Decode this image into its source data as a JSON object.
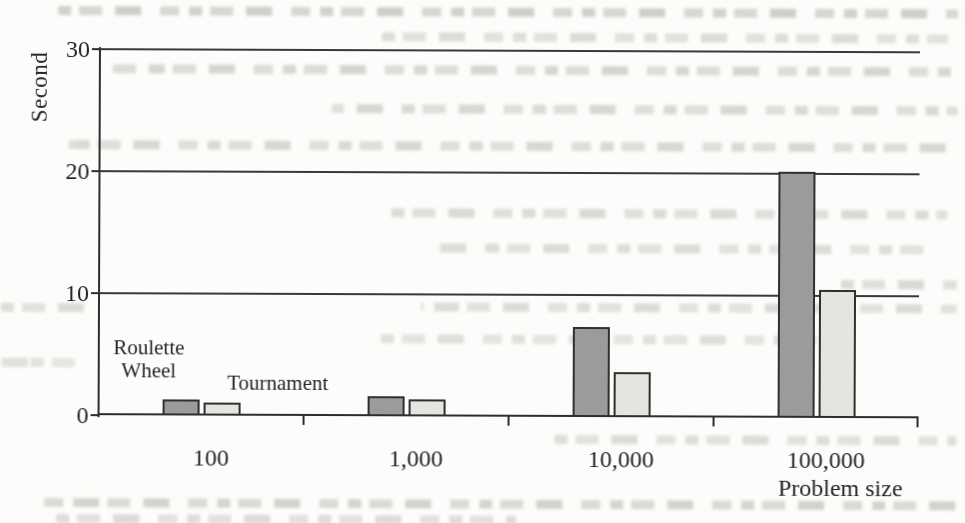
{
  "page": {
    "background": "#fcfcfa",
    "ink": "#262626"
  },
  "chart_data": {
    "type": "bar",
    "title": "",
    "ylabel": "Second",
    "xlabel": "Problem size",
    "categories": [
      "100",
      "1,000",
      "10,000",
      "100,000"
    ],
    "series": [
      {
        "name": "Roulette Wheel",
        "fill": "#9b9b9b",
        "values": [
          1.3,
          1.6,
          7.4,
          20.2
        ]
      },
      {
        "name": "Tournament",
        "fill": "#e4e4e1",
        "values": [
          1.1,
          1.4,
          3.7,
          10.5
        ]
      }
    ],
    "ylim": [
      0,
      30
    ],
    "y_ticks": [
      0,
      10,
      20,
      30
    ],
    "grid": "horizontal",
    "legend_position": "inline-annotations-near-first-group",
    "bar_border": "#2f2f2f"
  },
  "annotations": {
    "series1_label": "Roulette Wheel",
    "series2_label": "Tournament"
  }
}
